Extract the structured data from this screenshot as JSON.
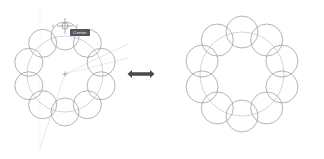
{
  "canvas": {
    "width": 324,
    "height": 159,
    "background": "#ffffff",
    "title": "Polar array of circles — before and after"
  },
  "colors": {
    "circle_stroke": "#9a9aa2",
    "ring_guide": "#b9b9c0",
    "centerline": "#e7c9d6",
    "construction": "#ddd6d0",
    "snap_marker": "#8f8f98",
    "tooltip_bg": "#55555c",
    "tooltip_text": "#f2f2f2",
    "arrow": "#4a4a4a"
  },
  "left_panel": {
    "name": "array-in-progress",
    "center": {
      "x": 65,
      "y": 74
    },
    "ring_radius": 38,
    "circle_radius": 14,
    "circle_count": 10,
    "start_angle_deg": -90,
    "center_marker": "plus-marker",
    "centerline": {
      "label": "vertical-centerline",
      "x": 40,
      "y1": 6,
      "y2": 155,
      "dash": "1,3"
    },
    "construction_lines": [
      {
        "label": "diagonal-guide-upper",
        "x1": 65,
        "y1": 74,
        "x2": 128,
        "y2": 44
      },
      {
        "label": "diagonal-guide-lower",
        "x1": 65,
        "y1": 74,
        "x2": 128,
        "y2": 58
      },
      {
        "label": "diagonal-guide-tail",
        "x1": 65,
        "y1": 74,
        "x2": 40,
        "y2": 148
      }
    ],
    "snap": {
      "label": "snap-crosshair",
      "x": 65,
      "y": 26,
      "radius": 3.1
    },
    "tooltip": {
      "label": "snap-tooltip",
      "text": "Center",
      "x": 70,
      "y": 29,
      "width": 20,
      "height": 7
    }
  },
  "transition": {
    "name": "double-arrow",
    "glyph": "double-headed-arrow",
    "x": 141,
    "y": 74,
    "length": 27,
    "thickness": 8
  },
  "right_panel": {
    "name": "array-result",
    "center": {
      "x": 242,
      "y": 74
    },
    "ring_radius": 42,
    "circle_radius": 16,
    "circle_count": 10,
    "start_angle_deg": -90,
    "center_marker": "none",
    "centerline": null,
    "construction_lines": []
  }
}
